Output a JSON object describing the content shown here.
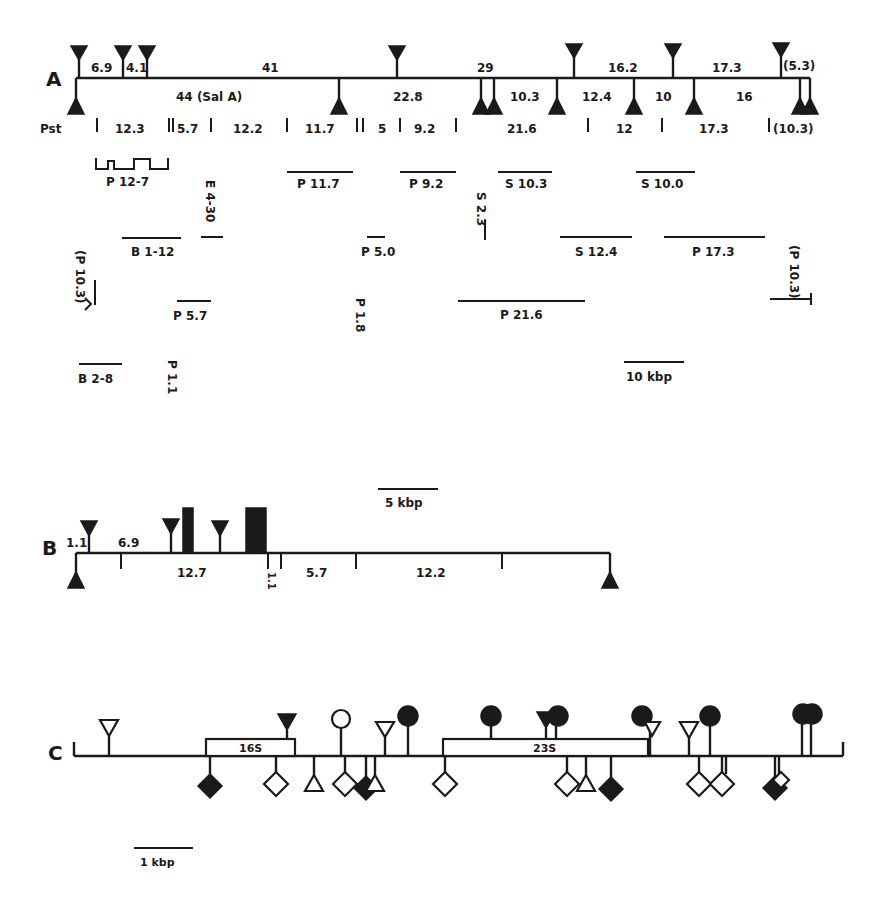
{
  "panels": {
    "A": {
      "label": "A",
      "top_fragments": [
        "6.9",
        "4.1",
        "41",
        "29",
        "16.2",
        "17.3",
        "(5.3)"
      ],
      "bottom_fragments": [
        "44 (Sal A)",
        "22.8",
        "10.3",
        "12.4",
        "10",
        "16"
      ],
      "pst_label": "Pst",
      "pst_fragments": [
        "12.3",
        "5.7",
        "12.2",
        "11.7",
        "5",
        "9.2",
        "21.6",
        "12",
        "17.3",
        "(10.3)"
      ],
      "clones": [
        "P 12-7",
        "P 11.7",
        "P 9.2",
        "S 10.3",
        "S 10.0",
        "E 4-30",
        "S 2.3",
        "B 1-12",
        "P 5.0",
        "S 12.4",
        "P 17.3",
        "(P 10.3)",
        "(P 10.3)",
        "P 5.7",
        "P 1.8",
        "P 21.6",
        "B 2-8",
        "P 1.1"
      ],
      "scale_bar": "10 kbp"
    },
    "B": {
      "label": "B",
      "scale_bar": "5 kbp",
      "top_fragments": [
        "1.1",
        "6.9"
      ],
      "bottom_fragments": [
        "12.7",
        "1.1",
        "5.7",
        "12.2"
      ]
    },
    "C": {
      "label": "C",
      "genes": [
        "16S",
        "23S"
      ],
      "scale_bar": "1 kbp"
    }
  }
}
